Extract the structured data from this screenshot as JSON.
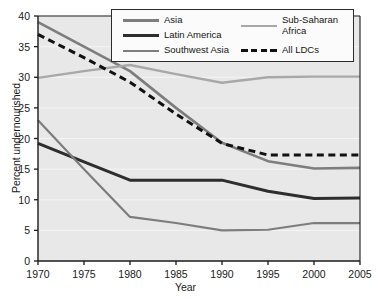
{
  "chart_data": {
    "type": "line",
    "title": "",
    "xlabel": "Year",
    "ylabel": "Percent undernourished",
    "x": [
      1970,
      1975,
      1980,
      1985,
      1990,
      1995,
      2000,
      2005
    ],
    "xlim": [
      1970,
      2005
    ],
    "ylim": [
      0,
      40
    ],
    "xticks": [
      "1970",
      "1975",
      "1980",
      "1985",
      "1990",
      "1995",
      "2000",
      "2005"
    ],
    "yticks": [
      "0",
      "5",
      "10",
      "15",
      "20",
      "25",
      "30",
      "35",
      "40"
    ],
    "grid": true,
    "legend_position": "top-center",
    "series": [
      {
        "name": "Asia",
        "color": "#7d7d7d",
        "style": "solid",
        "width": 2.6,
        "values": [
          39.0,
          35.0,
          31.0,
          25.0,
          19.3,
          16.3,
          15.1,
          15.2
        ]
      },
      {
        "name": "Latin America",
        "color": "#2e2e2e",
        "style": "solid",
        "width": 3.0,
        "values": [
          19.2,
          16.2,
          13.2,
          13.2,
          13.2,
          11.4,
          10.2,
          10.3
        ]
      },
      {
        "name": "Southwest Asia",
        "color": "#7d7d7d",
        "style": "solid",
        "width": 2.2,
        "values": [
          23.0,
          15.0,
          7.2,
          6.2,
          5.0,
          5.1,
          6.2,
          6.2
        ]
      },
      {
        "name": "Sub-Saharan Africa",
        "color": "#a8a8a8",
        "style": "solid",
        "width": 2.4,
        "values": [
          29.9,
          31.0,
          32.0,
          30.5,
          29.1,
          30.0,
          30.1,
          30.1
        ]
      },
      {
        "name": "All LDCs",
        "color": "#111111",
        "style": "dashed",
        "width": 3.0,
        "values": [
          37.0,
          33.2,
          29.2,
          24.0,
          19.2,
          17.3,
          17.3,
          17.3
        ]
      }
    ]
  },
  "legend": {
    "entries": [
      {
        "label": "Asia"
      },
      {
        "label": "Latin America"
      },
      {
        "label": "Southwest Asia"
      },
      {
        "label": "Sub-Saharan",
        "label2": "Africa"
      },
      {
        "label": "All LDCs"
      }
    ]
  },
  "axes": {
    "x_title": "Year",
    "y_title": "Percent undernourished"
  },
  "colors": {
    "plot_background": "#e8e8e8",
    "gridline": "#f4f4f4",
    "axis": "#1a1a1a",
    "page_background": "#ffffff"
  }
}
